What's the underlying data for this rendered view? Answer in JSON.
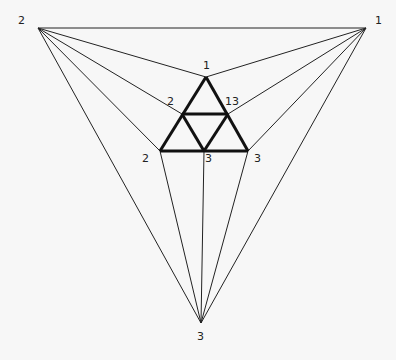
{
  "diagram": {
    "type": "planar-graph-triangulation",
    "outer_vertices": [
      {
        "id": "TL",
        "x": 38,
        "y": 28,
        "label": "2",
        "lx": 18,
        "ly": 24
      },
      {
        "id": "TR",
        "x": 366,
        "y": 28,
        "label": "1",
        "lx": 375,
        "ly": 24
      },
      {
        "id": "B",
        "x": 201,
        "y": 323,
        "label": "3",
        "lx": 197,
        "ly": 340
      }
    ],
    "inner_vertices": [
      {
        "id": "A",
        "x": 206,
        "y": 77,
        "label": "1",
        "lx": 203,
        "ly": 69
      },
      {
        "id": "ML",
        "x": 182,
        "y": 114,
        "label": "2",
        "lx": 167,
        "ly": 105
      },
      {
        "id": "MR",
        "x": 228,
        "y": 114,
        "label": "13",
        "lx": 225,
        "ly": 105
      },
      {
        "id": "BL",
        "x": 160,
        "y": 151,
        "label": "2",
        "lx": 142,
        "ly": 162
      },
      {
        "id": "BM",
        "x": 204,
        "y": 151,
        "label": "3",
        "lx": 205,
        "ly": 162
      },
      {
        "id": "BR",
        "x": 248,
        "y": 151,
        "label": "3",
        "lx": 254,
        "ly": 162
      }
    ],
    "thick_edges": [
      [
        "A",
        "BL"
      ],
      [
        "A",
        "BR"
      ],
      [
        "BL",
        "BR"
      ],
      [
        "ML",
        "MR"
      ],
      [
        "ML",
        "BM"
      ],
      [
        "MR",
        "BM"
      ]
    ],
    "thin_edges": [
      [
        "TL",
        "TR"
      ],
      [
        "TL",
        "B"
      ],
      [
        "TR",
        "B"
      ],
      [
        "TL",
        "A"
      ],
      [
        "TL",
        "ML"
      ],
      [
        "TL",
        "BL"
      ],
      [
        "TR",
        "A"
      ],
      [
        "TR",
        "MR"
      ],
      [
        "TR",
        "BR"
      ],
      [
        "B",
        "BL"
      ],
      [
        "B",
        "BM"
      ],
      [
        "B",
        "BR"
      ]
    ],
    "labels": [
      "2",
      "1",
      "3",
      "1",
      "2",
      "13",
      "2",
      "3",
      "3"
    ]
  }
}
